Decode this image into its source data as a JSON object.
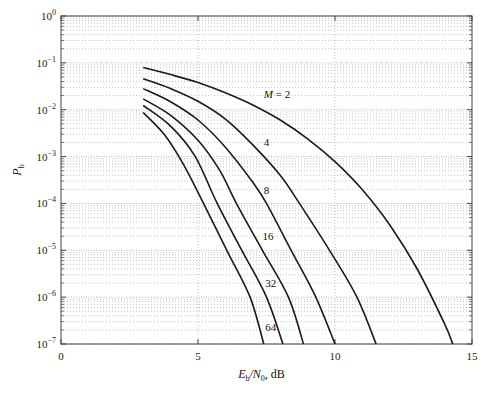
{
  "chart_data": {
    "type": "line",
    "title": "",
    "xlabel": "E_b/N_0, dB",
    "ylabel": "P_b",
    "xscale": "linear",
    "yscale": "log",
    "xlim": [
      0,
      15
    ],
    "ylim": [
      1e-07,
      1
    ],
    "x_ticks": [
      0,
      5,
      10,
      15
    ],
    "x_tick_labels": [
      "0",
      "5",
      "10",
      "15"
    ],
    "y_ticks_log10": [
      0,
      -1,
      -2,
      -3,
      -4,
      -5,
      -6,
      -7
    ],
    "y_tick_labels": [
      "10^0",
      "10^-1",
      "10^-2",
      "10^-3",
      "10^-4",
      "10^-5",
      "10^-6",
      "10^-7"
    ],
    "grid": true,
    "grid_style": "dotted",
    "legend": "inline curve labels",
    "series": [
      {
        "name": "M = 2",
        "label_text": "M = 2",
        "label_pos": [
          7.4,
          -1.76
        ],
        "points_db_log10pb": [
          [
            3,
            -1.1
          ],
          [
            4,
            -1.25
          ],
          [
            5,
            -1.42
          ],
          [
            6,
            -1.64
          ],
          [
            7,
            -1.9
          ],
          [
            8,
            -2.22
          ],
          [
            9,
            -2.62
          ],
          [
            10,
            -3.11
          ],
          [
            11,
            -3.71
          ],
          [
            12,
            -4.46
          ],
          [
            13,
            -5.4
          ],
          [
            14,
            -6.57
          ],
          [
            14.3,
            -7.0
          ]
        ]
      },
      {
        "name": "M = 4",
        "label_text": "4",
        "label_pos": [
          7.4,
          -2.77
        ],
        "points_db_log10pb": [
          [
            3,
            -1.34
          ],
          [
            4,
            -1.55
          ],
          [
            5,
            -1.82
          ],
          [
            6,
            -2.2
          ],
          [
            7,
            -2.75
          ],
          [
            8,
            -3.4
          ],
          [
            8.7,
            -4.0
          ],
          [
            9.8,
            -5.0
          ],
          [
            10.8,
            -6.0
          ],
          [
            11.5,
            -7.0
          ]
        ]
      },
      {
        "name": "M = 8",
        "label_text": "8",
        "label_pos": [
          7.4,
          -3.79
        ],
        "points_db_log10pb": [
          [
            3,
            -1.55
          ],
          [
            4,
            -1.83
          ],
          [
            5,
            -2.22
          ],
          [
            6,
            -2.8
          ],
          [
            7,
            -3.55
          ],
          [
            7.5,
            -4.0
          ],
          [
            8.4,
            -5.0
          ],
          [
            9.3,
            -6.0
          ],
          [
            10.0,
            -7.0
          ]
        ]
      },
      {
        "name": "M = 16",
        "label_text": "16",
        "label_pos": [
          7.35,
          -4.79
        ],
        "points_db_log10pb": [
          [
            3,
            -1.77
          ],
          [
            4,
            -2.12
          ],
          [
            5,
            -2.65
          ],
          [
            5.8,
            -3.3
          ],
          [
            6.4,
            -4.0
          ],
          [
            7.35,
            -5.0
          ],
          [
            8.3,
            -6.0
          ],
          [
            8.85,
            -7.0
          ]
        ]
      },
      {
        "name": "M = 32",
        "label_text": "32",
        "label_pos": [
          7.45,
          -5.79
        ],
        "points_db_log10pb": [
          [
            3,
            -1.91
          ],
          [
            4,
            -2.35
          ],
          [
            4.9,
            -3.0
          ],
          [
            5.7,
            -4.0
          ],
          [
            6.6,
            -5.0
          ],
          [
            7.5,
            -6.0
          ],
          [
            8.1,
            -7.0
          ]
        ]
      },
      {
        "name": "M = 64",
        "label_text": "64",
        "label_pos": [
          7.45,
          -6.72
        ],
        "points_db_log10pb": [
          [
            3,
            -2.06
          ],
          [
            3.8,
            -2.55
          ],
          [
            4.5,
            -3.2
          ],
          [
            5.2,
            -4.0
          ],
          [
            6.05,
            -5.0
          ],
          [
            6.9,
            -6.0
          ],
          [
            7.4,
            -7.0
          ]
        ]
      }
    ]
  },
  "colors": {
    "curve": "#1a1a1a",
    "axis": "#444444",
    "grid": "#9a9a9a",
    "text": "#222222"
  },
  "layout": {
    "plot_left": 61,
    "plot_right": 472,
    "plot_top": 16,
    "plot_bottom": 344
  }
}
